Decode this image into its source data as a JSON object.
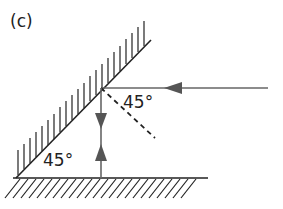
{
  "figure": {
    "panel_label": "(c)",
    "angles": {
      "incidence_label": "45°",
      "mirror_ground_label": "45°"
    },
    "elements": {
      "mirror": "inclined mirror (hatched)",
      "ground": "horizontal surface (hatched)",
      "incident_ray": "horizontal ray travelling leftward",
      "reflected_ray": "vertical ray travelling downward",
      "normal": "dashed normal line"
    },
    "colors": {
      "line": "#222222",
      "ray": "#666666"
    }
  }
}
